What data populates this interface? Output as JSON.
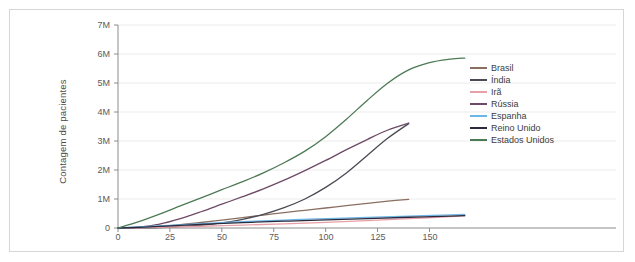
{
  "chart_data": {
    "type": "line",
    "title": "",
    "xlabel": "",
    "ylabel": "Contagem de pacientes",
    "xlim": [
      0,
      170
    ],
    "ylim": [
      0,
      7000000
    ],
    "grid": true,
    "legend_position": "right",
    "xticks": [
      "0",
      "25",
      "50",
      "75",
      "100",
      "125",
      "150"
    ],
    "xtick_values": [
      0,
      25,
      50,
      75,
      100,
      125,
      150
    ],
    "yticks": [
      "0",
      "1M",
      "2M",
      "3M",
      "4M",
      "5M",
      "6M",
      "7M"
    ],
    "ytick_values": [
      0,
      1000000,
      2000000,
      3000000,
      4000000,
      5000000,
      6000000,
      7000000
    ],
    "series": [
      {
        "name": "Brasil",
        "color": "#8a6f62",
        "x": [
          0,
          10,
          20,
          30,
          40,
          50,
          60,
          70,
          80,
          90,
          100,
          110,
          120,
          130,
          140
        ],
        "values": [
          0,
          15000,
          55000,
          115000,
          190000,
          275000,
          360000,
          445000,
          530000,
          610000,
          690000,
          770000,
          850000,
          925000,
          990000
        ]
      },
      {
        "name": "Índia",
        "color": "#4a4a55",
        "x": [
          0,
          10,
          20,
          30,
          40,
          50,
          60,
          70,
          80,
          90,
          100,
          110,
          120,
          130,
          140
        ],
        "values": [
          0,
          5000,
          18000,
          45000,
          95000,
          175000,
          300000,
          470000,
          700000,
          1000000,
          1400000,
          1900000,
          2500000,
          3100000,
          3600000
        ]
      },
      {
        "name": "Irã",
        "color": "#e8a0a8",
        "x": [
          0,
          20,
          40,
          60,
          80,
          100,
          120,
          140,
          160,
          167
        ],
        "values": [
          0,
          25000,
          60000,
          100000,
          145000,
          195000,
          255000,
          320000,
          390000,
          420000
        ]
      },
      {
        "name": "Rússia",
        "color": "#6d4a66",
        "x": [
          0,
          10,
          20,
          30,
          40,
          50,
          60,
          70,
          80,
          90,
          100,
          110,
          120,
          130,
          140
        ],
        "values": [
          0,
          30000,
          130000,
          320000,
          560000,
          820000,
          1080000,
          1350000,
          1650000,
          1980000,
          2330000,
          2700000,
          3050000,
          3380000,
          3620000
        ]
      },
      {
        "name": "Espanha",
        "color": "#6cb6e8",
        "x": [
          0,
          20,
          40,
          60,
          80,
          100,
          120,
          140,
          160,
          167
        ],
        "values": [
          0,
          70000,
          150000,
          220000,
          275000,
          320000,
          365000,
          410000,
          450000,
          465000
        ]
      },
      {
        "name": "Reino Unido",
        "color": "#2b2b3d",
        "x": [
          0,
          20,
          40,
          60,
          80,
          100,
          120,
          140,
          160,
          167
        ],
        "values": [
          0,
          55000,
          125000,
          185000,
          235000,
          280000,
          325000,
          370000,
          410000,
          425000
        ]
      },
      {
        "name": "Estados Unidos",
        "color": "#4d7a55",
        "x": [
          0,
          10,
          20,
          30,
          40,
          50,
          60,
          70,
          80,
          90,
          100,
          110,
          120,
          130,
          140,
          150,
          160,
          167
        ],
        "values": [
          0,
          220000,
          480000,
          760000,
          1040000,
          1320000,
          1600000,
          1900000,
          2250000,
          2650000,
          3150000,
          3750000,
          4400000,
          5000000,
          5450000,
          5700000,
          5820000,
          5860000
        ]
      }
    ]
  },
  "legend": {
    "items": [
      {
        "label": "Brasil",
        "color": "#8a6f62"
      },
      {
        "label": "Índia",
        "color": "#4a4a55"
      },
      {
        "label": "Irã",
        "color": "#e8a0a8"
      },
      {
        "label": "Rússia",
        "color": "#6d4a66"
      },
      {
        "label": "Espanha",
        "color": "#6cb6e8"
      },
      {
        "label": "Reino Unido",
        "color": "#2b2b3d"
      },
      {
        "label": "Estados Unidos",
        "color": "#4d7a55"
      }
    ]
  },
  "style": {
    "axis_color": "#8c8c8c",
    "grid_color": "#ebebeb",
    "frame_color": "#d6d6d6",
    "tick_text_color": "#5a5a5a"
  }
}
